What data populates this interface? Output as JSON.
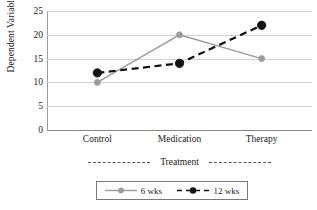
{
  "chart_data": {
    "type": "line",
    "title": "",
    "xlabel": "Treatment",
    "ylabel": "Dependent Variable",
    "categories": [
      "Control",
      "Medication",
      "Therapy"
    ],
    "series": [
      {
        "name": "6 wks",
        "values": [
          10,
          20,
          15
        ],
        "color": "#9b9b9b",
        "linestyle": "solid",
        "marker": "circle"
      },
      {
        "name": "12 wks",
        "values": [
          12,
          14,
          22
        ],
        "color": "#111111",
        "linestyle": "dashed",
        "marker": "circle-filled"
      }
    ],
    "ylim": [
      0,
      25
    ],
    "yticks": [
      0,
      5,
      10,
      15,
      20,
      25
    ],
    "ytick_labels": [
      "0",
      "5",
      "10",
      "15",
      "20",
      "25"
    ],
    "grid": "horizontal",
    "legend_position": "bottom",
    "background": "#ffffff"
  },
  "axes": {
    "y_title": "Dependent Variable",
    "x_title": "Treatment",
    "x_labels": [
      "Control",
      "Medication",
      "Therapy"
    ],
    "y_labels": [
      "25",
      "20",
      "15",
      "10",
      "5",
      "0"
    ]
  },
  "legend": {
    "entries": [
      {
        "label": "6 wks"
      },
      {
        "label": "12 wks"
      }
    ]
  }
}
